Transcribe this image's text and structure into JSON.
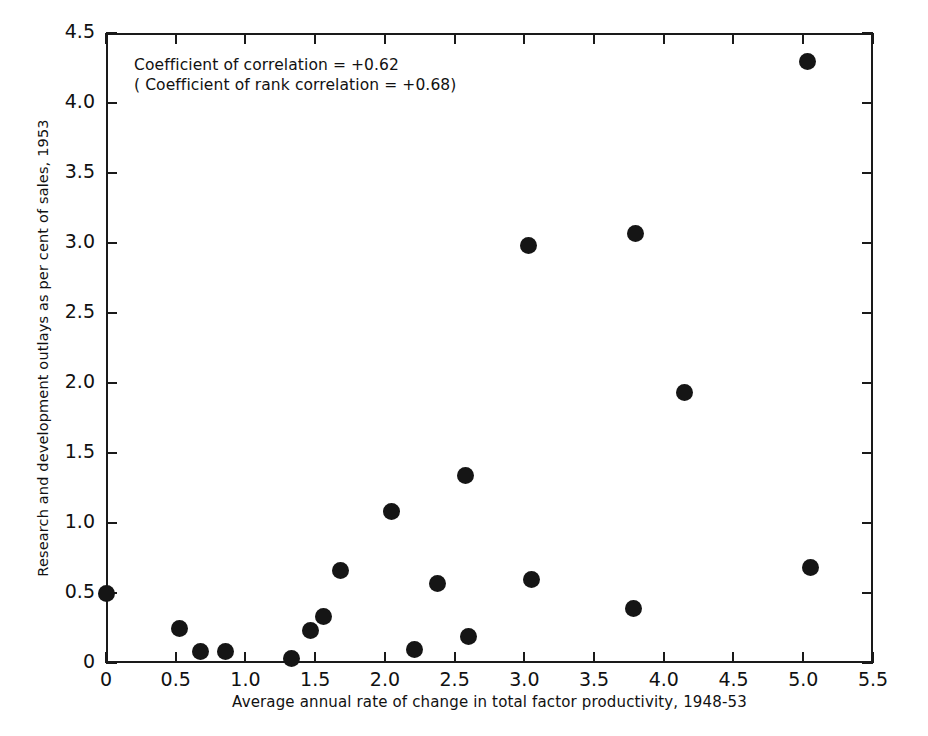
{
  "chart_data": {
    "type": "scatter",
    "title": "",
    "xlabel": "Average annual rate of change in total factor productivity, 1948-53",
    "ylabel": "Research and development outlays as per cent of sales, 1953",
    "xlim": [
      0,
      5.5
    ],
    "ylim": [
      0,
      4.5
    ],
    "grid": false,
    "legend": "none",
    "marker": "filled-circle",
    "marker_color": "#151515",
    "xticks": [
      "0",
      "0.5",
      "1.0",
      "1.5",
      "2.0",
      "2.5",
      "3.0",
      "3.5",
      "4.0",
      "4.5",
      "5.0",
      "5.5"
    ],
    "xtick_values": [
      0,
      0.5,
      1.0,
      1.5,
      2.0,
      2.5,
      3.0,
      3.5,
      4.0,
      4.5,
      5.0,
      5.5
    ],
    "yticks": [
      "0",
      "0.5",
      "1.0",
      "1.5",
      "2.0",
      "2.5",
      "3.0",
      "3.5",
      "4.0",
      "4.5"
    ],
    "ytick_values": [
      0,
      0.5,
      1.0,
      1.5,
      2.0,
      2.5,
      3.0,
      3.5,
      4.0,
      4.5
    ],
    "points": [
      {
        "x": 0.0,
        "y": 0.5
      },
      {
        "x": 0.53,
        "y": 0.25
      },
      {
        "x": 0.68,
        "y": 0.08
      },
      {
        "x": 0.86,
        "y": 0.08
      },
      {
        "x": 1.33,
        "y": 0.03
      },
      {
        "x": 1.47,
        "y": 0.23
      },
      {
        "x": 1.56,
        "y": 0.33
      },
      {
        "x": 1.68,
        "y": 0.66
      },
      {
        "x": 2.05,
        "y": 1.08
      },
      {
        "x": 2.21,
        "y": 0.1
      },
      {
        "x": 2.38,
        "y": 0.57
      },
      {
        "x": 2.58,
        "y": 1.34
      },
      {
        "x": 2.6,
        "y": 0.19
      },
      {
        "x": 3.03,
        "y": 2.98
      },
      {
        "x": 3.05,
        "y": 0.6
      },
      {
        "x": 3.78,
        "y": 0.39
      },
      {
        "x": 3.8,
        "y": 3.07
      },
      {
        "x": 4.15,
        "y": 1.93
      },
      {
        "x": 5.03,
        "y": 4.3
      },
      {
        "x": 5.05,
        "y": 0.68
      }
    ],
    "annotations": [
      "Coefficient of correlation = +0.62",
      "( Coefficient of rank correlation = +0.68)"
    ],
    "statistics": {
      "coefficient_of_correlation": "+0.62",
      "coefficient_of_rank_correlation": "+0.68"
    }
  }
}
